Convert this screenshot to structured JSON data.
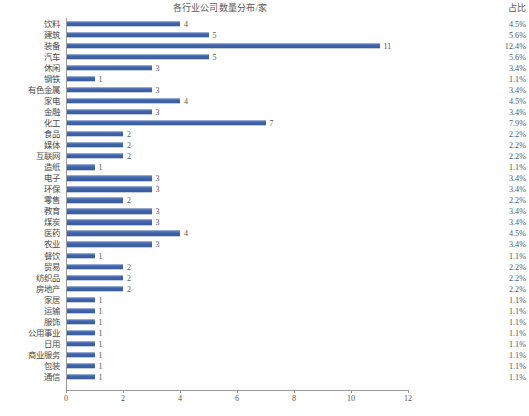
{
  "chart_data": {
    "type": "bar",
    "orientation": "horizontal",
    "title": "各行业公司数量分布/家",
    "xlabel": "",
    "ylabel": "",
    "xlim": [
      0,
      12
    ],
    "xticks": [
      0,
      2,
      4,
      6,
      8,
      10,
      12
    ],
    "grid": false,
    "legend": false,
    "bar_color": "#4a6db0",
    "axis_color": "#9a9a9a",
    "side_column_header": "占比",
    "categories": [
      "饮料",
      "建筑",
      "装备",
      "汽车",
      "休闲",
      "钢铁",
      "有色金属",
      "家电",
      "金融",
      "化工",
      "食品",
      "媒体",
      "互联网",
      "造纸",
      "电子",
      "环保",
      "零售",
      "教育",
      "煤炭",
      "医药",
      "农业",
      "餐饮",
      "贸易",
      "纺织品",
      "房地产",
      "家居",
      "运输",
      "服饰",
      "公用事业",
      "日用",
      "商业服务",
      "包装",
      "通信"
    ],
    "values": [
      4,
      5,
      11,
      5,
      3,
      1,
      3,
      4,
      3,
      7,
      2,
      2,
      2,
      1,
      3,
      3,
      2,
      3,
      3,
      4,
      3,
      1,
      2,
      2,
      2,
      1,
      1,
      1,
      1,
      1,
      1,
      1,
      1
    ],
    "data_labels": [
      "4",
      "5",
      "11",
      "5",
      "3",
      "1",
      "3",
      "4",
      "3",
      "7",
      "2",
      "2",
      "2",
      "1",
      "3",
      "3",
      "2",
      "3",
      "3",
      "4",
      "3",
      "1",
      "2",
      "2",
      "2",
      "1",
      "1",
      "1",
      "1",
      "1",
      "1",
      "1",
      "1"
    ],
    "percentages": [
      "4.5%",
      "5.6%",
      "12.4%",
      "5.6%",
      "3.4%",
      "1.1%",
      "3.4%",
      "4.5%",
      "3.4%",
      "7.9%",
      "2.2%",
      "2.2%",
      "2.2%",
      "1.1%",
      "3.4%",
      "3.4%",
      "2.2%",
      "3.4%",
      "3.4%",
      "4.5%",
      "3.4%",
      "1.1%",
      "2.2%",
      "2.2%",
      "2.2%",
      "1.1%",
      "1.1%",
      "1.1%",
      "1.1%",
      "1.1%",
      "1.1%",
      "1.1%",
      "1.1%"
    ]
  }
}
